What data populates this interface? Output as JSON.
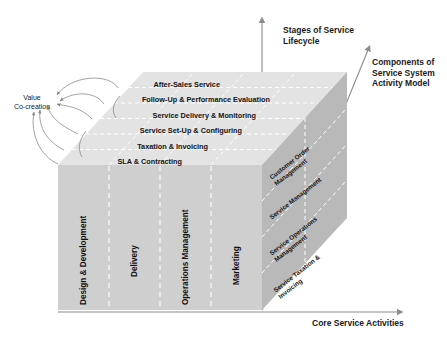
{
  "axes": {
    "vertical": "Stages of Service\nLifecycle",
    "depth": "Components of\nService System\nActivity Model",
    "horizontal": "Core Service Activities"
  },
  "annotation": {
    "value_cocreation": "Value\nCo-creation"
  },
  "top_face": {
    "title": "Stages of Service Lifecycle",
    "rows": [
      "After-Sales Service",
      "Follow-Up & Performance Evaluation",
      "Service Delivery & Monitoring",
      "Service Set-Up & Configuring",
      "Taxation & Invoicing",
      "SLA & Contracting"
    ]
  },
  "front_face": {
    "title": "Core Service Activities",
    "columns": [
      "Design & Development",
      "Delivery",
      "Operations Management",
      "Marketing"
    ]
  },
  "right_face": {
    "title": "Components of Service System Activity Model",
    "labels": [
      "Customer Order\nManagement",
      "Service Management",
      "Service Operations\nManagement",
      "Service Taxation &\nInvoicing"
    ]
  },
  "colors": {
    "front_face": "#cfcfcf",
    "top_face": "#e3e3e3",
    "right_face": "#b9b9b9",
    "axis": "#8c8c8c",
    "dash": "#ffffff",
    "text": "#141414"
  }
}
